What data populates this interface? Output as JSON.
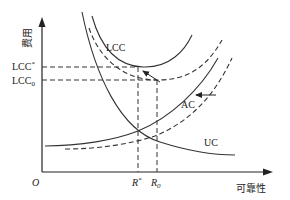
{
  "diagram": {
    "type": "cost-reliability tradeoff diagram",
    "axes": {
      "y_label": "费用",
      "x_label": "可靠性",
      "origin_label": "O"
    },
    "curves": {
      "lcc": {
        "label": "LCC",
        "style": "solid",
        "shifted_style": "dashed"
      },
      "ac": {
        "label": "AC",
        "style": "solid",
        "shifted_style": "dashed"
      },
      "uc": {
        "label": "UC",
        "style": "solid"
      }
    },
    "y_ticks": {
      "lcc_star": "LCC*",
      "lcc_zero_base": "LCC",
      "lcc_zero_sub": "0"
    },
    "x_ticks": {
      "r_star_base": "R",
      "r_star_sup": "*",
      "r_zero_base": "R",
      "r_zero_sub": "0"
    },
    "arrows": [
      {
        "name": "lcc-shift-arrow",
        "meaning": "LCC optimum shifts from LCC0 to LCC*"
      },
      {
        "name": "ac-shift-arrow",
        "meaning": "AC curve shifts left"
      }
    ]
  }
}
